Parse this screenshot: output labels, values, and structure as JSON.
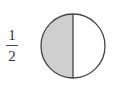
{
  "fraction": {
    "numerator": "1",
    "denominator": "2"
  },
  "circle": {
    "parts": 2,
    "shaded_parts": 1,
    "shaded_side": "left",
    "shade_color": "#cfcfcf",
    "stroke_color": "#444444",
    "fill_color": "#ffffff"
  }
}
